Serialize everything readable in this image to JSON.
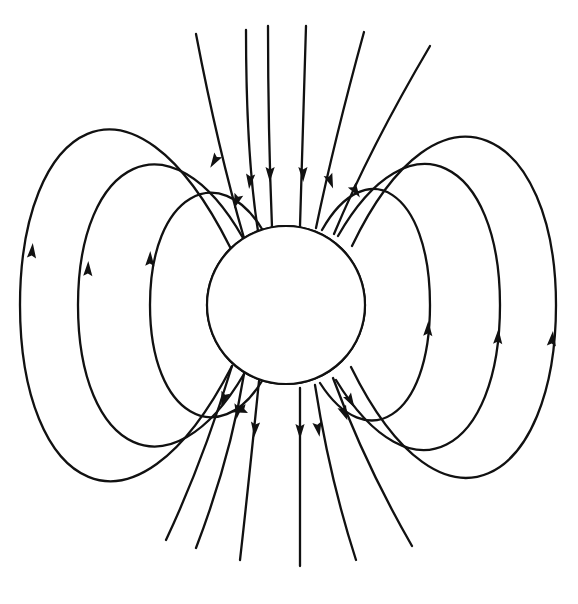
{
  "figure": {
    "title": "Earth's dipole magnetic field",
    "subject": "Earth",
    "diagram_type": "magnetic field line diagram",
    "background_color": "#ffffff",
    "line_color": "#111111",
    "continent_fill_color": "#b3b3b3",
    "earth_fill_color": "#ffffff",
    "interior_line_style": "dashed",
    "exterior_line_style": "solid"
  },
  "earth": {
    "label": "Earth",
    "center_x": 286,
    "center_y": 305,
    "radius": 79,
    "stroke_width": 2.2,
    "continents": [
      {
        "name": "North America",
        "fill": "#b3b3b3",
        "stroke": "#111111",
        "stroke_width": 2.4,
        "path": "M 292 238 L 296 232 L 302 234 L 307 231 L 311 235 L 315 231 L 318 234 L 321 230 L 326 233 L 329 230 L 333 233 L 330 237 L 335 238 L 334 233 L 338 230 L 342 233 L 340 238 L 335 242 L 339 245 L 342 243 L 345 247 L 342 252 L 337 251 L 339 256 L 344 258 L 341 264 L 336 262 L 333 267 L 337 271 L 333 276 L 327 274 L 323 279 L 318 276 L 314 281 L 310 286 L 306 291 L 303 286 L 299 290 L 296 285 L 293 289 L 290 284 L 287 288 L 284 283 L 281 286 L 278 281 L 276 275 L 279 270 L 276 265 L 279 260 L 276 255 L 280 250 L 277 245 L 282 242 L 286 245 L 289 241 Z"
      },
      {
        "name": "Greenland",
        "fill": "#b3b3b3",
        "stroke": "#111111",
        "stroke_width": 2.2,
        "path": "M 330 231 L 335 228 L 339 231 L 337 236 L 332 236 Z"
      },
      {
        "name": "South America",
        "fill": "#b3b3b3",
        "stroke": "#111111",
        "stroke_width": 2.4,
        "path": "M 307 291 L 312 296 L 317 299 L 322 304 L 325 310 L 326 317 L 324 324 L 321 331 L 318 339 L 316 347 L 313 355 L 311 363 L 308 371 L 306 378 L 303 383 L 300 379 L 299 372 L 297 364 L 294 356 L 291 348 L 288 341 L 285 334 L 282 327 L 280 320 L 281 312 L 285 306 L 290 301 L 296 297 L 301 293 Z"
      },
      {
        "name": "Alaska Peninsula",
        "fill": "#b3b3b3",
        "stroke": "#111111",
        "stroke_width": 2.0,
        "path": "M 211 334 L 216 337 L 220 343 L 222 350 L 218 353 L 214 347 L 210 341 Z"
      }
    ]
  },
  "field_lines": {
    "interior_dashed_count": 8,
    "exterior_loops_per_side": 3,
    "open_polar_lines": 8,
    "dash_pattern": "7 6",
    "interior_stroke_width": 1.9,
    "exterior_stroke_width": 2.3,
    "interior": [
      {
        "id": "dash-1",
        "path": "M 232 246 C 216 280 216 330 232 366"
      },
      {
        "id": "dash-2",
        "path": "M 243 238 C 228 276 228 334 244 374"
      },
      {
        "id": "dash-3",
        "path": "M 258 231 C 245 272 245 338 259 381"
      },
      {
        "id": "dash-4",
        "path": "M 272 227 C 263 270 263 340 273 386"
      },
      {
        "id": "dash-5",
        "path": "M 300 226 C 300 270 300 342 300 388"
      },
      {
        "id": "dash-6",
        "path": "M 316 228 C 322 270 322 340 315 385"
      },
      {
        "id": "dash-7",
        "path": "M 334 234 C 344 274 344 336 333 378"
      },
      {
        "id": "dash-8",
        "path": "M 350 245 C 364 280 364 330 350 366"
      }
    ],
    "exterior_loops_left": [
      {
        "id": "left-loop-inner",
        "path": "M 262 229 C 220 160 150 192 150 305 C 150 418 220 450 262 381"
      },
      {
        "id": "left-loop-mid",
        "path": "M 243 238 C 170 110 78 160 78 305 C 78 452 170 500 244 374"
      },
      {
        "id": "left-loop-outer",
        "path": "M 230 247 C 130 48 20 125 20 305 C 20 488 132 560 232 366"
      }
    ],
    "exterior_loops_right": [
      {
        "id": "right-loop-inner",
        "path": "M 322 230 C 366 152 430 190 430 305 C 430 420 366 455 320 383"
      },
      {
        "id": "right-loop-mid",
        "path": "M 338 236 C 410 110 500 160 500 305 C 500 452 412 505 336 380"
      },
      {
        "id": "right-loop-outer",
        "path": "M 352 246 C 440 62 556 130 556 305 C 556 482 444 556 351 367"
      }
    ],
    "open_polar_north": [
      {
        "id": "open-n-1",
        "path": "M 244 238 C 230 190 214 128 196 34"
      },
      {
        "id": "open-n-2",
        "path": "M 258 231 C 250 180 246 120 246 30"
      },
      {
        "id": "open-n-3",
        "path": "M 272 227 C 270 178 268 110 268 26"
      },
      {
        "id": "open-n-4",
        "path": "M 300 226 C 302 178 304 110 306 26"
      },
      {
        "id": "open-n-5",
        "path": "M 316 228 C 326 180 342 112 364 32"
      },
      {
        "id": "open-n-6",
        "path": "M 334 234 C 354 186 384 124 430 46"
      }
    ],
    "open_polar_south": [
      {
        "id": "open-s-1",
        "path": "M 232 366 C 218 412 198 472 166 540"
      },
      {
        "id": "open-s-2",
        "path": "M 244 374 C 236 424 222 480 196 548"
      },
      {
        "id": "open-s-3",
        "path": "M 259 381 C 254 430 248 490 240 560"
      },
      {
        "id": "open-s-4",
        "path": "M 300 388 C 300 434 300 494 300 566"
      },
      {
        "id": "open-s-5",
        "path": "M 315 385 C 322 430 334 492 356 560"
      },
      {
        "id": "open-s-6",
        "path": "M 333 378 C 350 424 374 480 412 546"
      }
    ],
    "arrows": [
      {
        "id": "arrow-n-1",
        "x": 237,
        "y": 200,
        "angle": 108,
        "desc": "downward-into-earth"
      },
      {
        "id": "arrow-n-2",
        "x": 250,
        "y": 180,
        "angle": 96,
        "desc": "downward-into-earth"
      },
      {
        "id": "arrow-n-3",
        "x": 270,
        "y": 173,
        "angle": 91,
        "desc": "downward-into-earth"
      },
      {
        "id": "arrow-n-4",
        "x": 303,
        "y": 173,
        "angle": 89,
        "desc": "downward-into-earth"
      },
      {
        "id": "arrow-n-5",
        "x": 330,
        "y": 180,
        "angle": 70,
        "desc": "downward-into-earth"
      },
      {
        "id": "arrow-n-6",
        "x": 355,
        "y": 190,
        "angle": 57,
        "desc": "downward-into-earth"
      },
      {
        "id": "arrow-n-loop-left",
        "x": 215,
        "y": 160,
        "angle": 122,
        "desc": "down-left-into-earth"
      },
      {
        "id": "arrow-s-1",
        "x": 224,
        "y": 398,
        "angle": 108,
        "desc": "downward-away-from-earth"
      },
      {
        "id": "arrow-s-2",
        "x": 238,
        "y": 410,
        "angle": 99,
        "desc": "downward-away-from-earth"
      },
      {
        "id": "arrow-s-3",
        "x": 255,
        "y": 428,
        "angle": 95,
        "desc": "downward-away-from-earth"
      },
      {
        "id": "arrow-s-4",
        "x": 300,
        "y": 430,
        "angle": 90,
        "desc": "downward-away-from-earth"
      },
      {
        "id": "arrow-s-5",
        "x": 318,
        "y": 428,
        "angle": 80,
        "desc": "downward-away-from-earth"
      },
      {
        "id": "arrow-s-6",
        "x": 344,
        "y": 412,
        "angle": 68,
        "desc": "downward-away-from-earth"
      },
      {
        "id": "arrow-left-inner-bottom",
        "x": 241,
        "y": 410,
        "angle": 165,
        "desc": "leftward-along-loop"
      },
      {
        "id": "arrow-left-inner-up",
        "x": 150,
        "y": 260,
        "angle": 272,
        "desc": "upward-along-loop"
      },
      {
        "id": "arrow-left-mid-up",
        "x": 88,
        "y": 270,
        "angle": 272,
        "desc": "upward-along-loop"
      },
      {
        "id": "arrow-left-outer-up",
        "x": 32,
        "y": 252,
        "angle": 275,
        "desc": "upward-along-loop"
      },
      {
        "id": "arrow-right-inner-up",
        "x": 428,
        "y": 330,
        "angle": 272,
        "desc": "upward-along-loop"
      },
      {
        "id": "arrow-right-mid-up",
        "x": 498,
        "y": 338,
        "angle": 273,
        "desc": "upward-along-loop"
      },
      {
        "id": "arrow-right-outer-up",
        "x": 552,
        "y": 340,
        "angle": 276,
        "desc": "upward-along-loop"
      },
      {
        "id": "arrow-right-inner-down",
        "x": 350,
        "y": 400,
        "angle": 60,
        "desc": "down-right-along-loop"
      }
    ]
  }
}
